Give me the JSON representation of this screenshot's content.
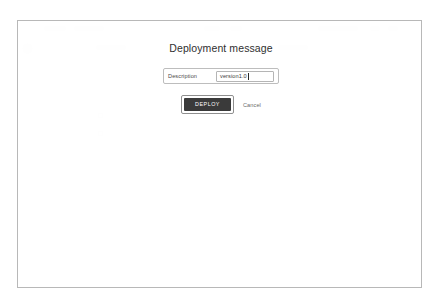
{
  "dialog": {
    "title": "Deployment message",
    "field": {
      "label": "Description",
      "value": "version1.0",
      "placeholder": "Description"
    },
    "primary_button": "DEPLOY",
    "cancel_link": "Cancel"
  },
  "colors": {
    "primary_button_bg": "#3a3a3a",
    "primary_button_text": "#ffffff",
    "dialog_text": "#2f2f2f",
    "frame_border": "#b8b8b8",
    "scrim": "rgba(255,255,255,0.90)"
  },
  "background_app": {
    "visible": false,
    "note": "Obscured by modal scrim; text not legible"
  }
}
